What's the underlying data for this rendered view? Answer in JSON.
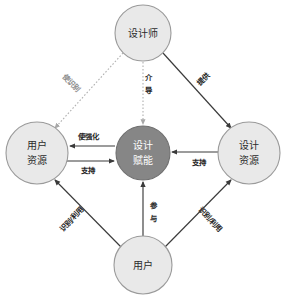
{
  "diagram": {
    "background_color": "#ffffff",
    "node_fill": "#e9e9e9",
    "node_stroke": "#9a9a9a",
    "center_fill": "#868686",
    "center_text_color": "#ffffff",
    "edge_color": "#3a3a3a",
    "dotted_edge_color": "#b0b0b0",
    "nodes": [
      {
        "id": "designer",
        "label_line1": "设计师",
        "label_line2": "",
        "cx": 143,
        "cy": 33,
        "r": 28,
        "style": "light"
      },
      {
        "id": "user-resources",
        "label_line1": "用户",
        "label_line2": "资源",
        "cx": 37,
        "cy": 153,
        "r": 31,
        "style": "light"
      },
      {
        "id": "design-empowerment",
        "label_line1": "设计",
        "label_line2": "赋能",
        "cx": 143,
        "cy": 153,
        "r": 27,
        "style": "dark"
      },
      {
        "id": "design-resources",
        "label_line1": "设计",
        "label_line2": "资源",
        "cx": 249,
        "cy": 153,
        "r": 31,
        "style": "light"
      },
      {
        "id": "user",
        "label_line1": "用户",
        "label_line2": "",
        "cx": 143,
        "cy": 265,
        "r": 29,
        "style": "light"
      }
    ],
    "edges": [
      {
        "id": "designer-to-user-resources",
        "from": "designer",
        "to": "user-resources",
        "label": "使识别",
        "line_style": "dotted",
        "label_rotation": 48,
        "label_x": 71,
        "label_y": 83
      },
      {
        "id": "designer-to-empowerment",
        "from": "designer",
        "to": "design-empowerment",
        "label_line1": "介",
        "label_line2": "导",
        "line_style": "dotted",
        "label_x": 148,
        "label_y": 84
      },
      {
        "id": "designer-to-design-resources",
        "from": "designer",
        "to": "design-resources",
        "label": "提供",
        "line_style": "solid",
        "label_rotation": -45,
        "label_x": 204,
        "label_y": 80
      },
      {
        "id": "empowerment-to-user-resources",
        "from": "design-empowerment",
        "to": "user-resources",
        "label": "使强化",
        "line_style": "solid",
        "label_x": 88,
        "label_y": 136
      },
      {
        "id": "user-resources-to-empowerment",
        "from": "user-resources",
        "to": "design-empowerment",
        "label": "支持",
        "line_style": "solid",
        "label_x": 88,
        "label_y": 168
      },
      {
        "id": "design-resources-to-empowerment",
        "from": "design-resources",
        "to": "design-empowerment",
        "label": "支持",
        "line_style": "solid",
        "label_x": 199,
        "label_y": 166
      },
      {
        "id": "user-to-empowerment",
        "from": "user",
        "to": "design-empowerment",
        "label_line1": "参",
        "label_line2": "与",
        "line_style": "solid",
        "label_x": 152,
        "label_y": 212
      },
      {
        "id": "user-to-user-resources",
        "from": "user",
        "to": "user-resources",
        "label": "识别/利用",
        "line_style": "solid",
        "label_rotation": -48,
        "label_x": 72,
        "label_y": 220
      },
      {
        "id": "user-to-design-resources",
        "from": "user",
        "to": "design-resources",
        "label": "识别/利用",
        "line_style": "solid",
        "label_rotation": 48,
        "label_x": 210,
        "label_y": 220
      }
    ]
  }
}
